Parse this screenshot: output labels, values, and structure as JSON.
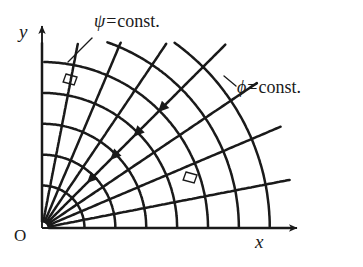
{
  "figure": {
    "kind": "flow-net-diagram",
    "background_color": "#ffffff",
    "line_color": "#1a1a1a",
    "labels": {
      "streamline_family": "ψ",
      "streamline_equals": "=",
      "streamline_value": "const.",
      "equipotential_family": "ϕ",
      "equipotential_equals": "=",
      "equipotential_value": "const.",
      "axis_x": "x",
      "axis_y": "y",
      "origin": "O"
    }
  },
  "chart_data": {
    "type": "line",
    "title": "",
    "subtitle": "",
    "xlabel": "x",
    "ylabel": "y",
    "xlim": [
      0,
      1.22
    ],
    "ylim": [
      0,
      1.02
    ],
    "grid": false,
    "legend_position": "inline-annotations",
    "annotations": [
      {
        "text": "ψ=const.",
        "anchor_px": [
          94,
          12
        ],
        "leader_from_px": [
          92,
          38
        ],
        "leader_to_px": [
          68,
          62
        ],
        "describes": "streamlines"
      },
      {
        "text": "ϕ=const.",
        "anchor_px": [
          237,
          78
        ],
        "leader_from_px": [
          236,
          86
        ],
        "leader_to_px": [
          224,
          76
        ],
        "describes": "equipotential lines"
      }
    ],
    "axes": {
      "origin_px": [
        42,
        228
      ],
      "x_axis_end_px": [
        297,
        228
      ],
      "y_axis_end_px": [
        42,
        26
      ],
      "arrowheads": [
        "x-axis-tip",
        "y-axis-tip"
      ]
    },
    "series": [
      {
        "name": "ψ=const.",
        "role": "streamlines",
        "description": "Radial rays emanating from the origin O at constant polar angle.",
        "geometry": "ray",
        "angles_deg": [
          0,
          11,
          23,
          34,
          45,
          56,
          67,
          79,
          90
        ],
        "count": 9,
        "radius_max": 1.35,
        "flow_direction": "inward, toward the origin (arrowheads on the 45° ray)",
        "arrow_count": 4,
        "arrow_radii": [
          0.88,
          0.7,
          0.53,
          0.36
        ]
      },
      {
        "name": "ϕ=const.",
        "role": "equipotentials",
        "description": "Circular arcs centred on the origin O at constant radius.",
        "geometry": "arc",
        "radii": [
          0.22,
          0.38,
          0.54,
          0.7,
          0.86,
          1.02,
          1.18
        ],
        "count": 7,
        "angle_span_deg": [
          0,
          90
        ]
      }
    ],
    "right_angle_markers": [
      {
        "position_px": [
          66,
          74
        ],
        "size_px": 11,
        "note": "orthogonality of the two families near the y-axis"
      },
      {
        "position_px": [
          186,
          172
        ],
        "size_px": 11,
        "note": "orthogonality of the two families in the lower right"
      }
    ]
  }
}
